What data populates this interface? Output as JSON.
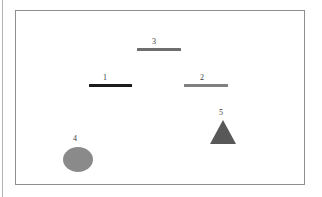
{
  "figure": {
    "background_color": "#ffffff",
    "frame_color": "#8e8e8e",
    "gutter_rule_color": "#b4b4b4",
    "label_color": "#3a3a3a"
  },
  "shapes": [
    {
      "id": "bar-1",
      "label": "1",
      "type": "bar",
      "color": "#1c1c1c",
      "x": 88,
      "y": 83,
      "width": 43,
      "height": 3,
      "label_x": 104,
      "label_y": 72
    },
    {
      "id": "bar-2",
      "label": "2",
      "type": "bar",
      "color": "#808080",
      "x": 183,
      "y": 83,
      "width": 44,
      "height": 3,
      "label_x": 201,
      "label_y": 72
    },
    {
      "id": "bar-3",
      "label": "3",
      "type": "bar",
      "color": "#6e6e6e",
      "x": 136,
      "y": 47,
      "width": 44,
      "height": 3,
      "label_x": 153,
      "label_y": 36
    },
    {
      "id": "ellipse-4",
      "label": "4",
      "type": "ellipse",
      "color": "#8a8a8a",
      "x": 62,
      "y": 146,
      "width": 30,
      "height": 25,
      "label_x": 74,
      "label_y": 133
    },
    {
      "id": "triangle-5",
      "label": "5",
      "type": "triangle",
      "color": "#585858",
      "x": 209,
      "y": 119,
      "width": 26,
      "height": 24,
      "label_x": 220,
      "label_y": 107
    }
  ]
}
